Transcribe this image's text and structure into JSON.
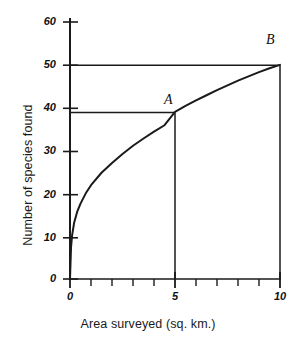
{
  "chart_data": {
    "type": "line",
    "title": "",
    "xlabel": "Area surveyed (sq. km.)",
    "ylabel": "Number of species found",
    "xlim": [
      0,
      10
    ],
    "ylim": [
      0,
      62
    ],
    "grid": false,
    "legend": null,
    "x_ticks_major": [
      0,
      5,
      10
    ],
    "x_tick_labels": [
      "0",
      "5",
      "10"
    ],
    "x_ticks_minor": [
      1,
      2,
      3,
      4,
      6,
      7,
      8,
      9
    ],
    "y_ticks": [
      0,
      10,
      20,
      30,
      40,
      50,
      60
    ],
    "y_tick_labels": [
      "0",
      "10",
      "20",
      "30",
      "40",
      "50",
      "60"
    ],
    "series": [
      {
        "name": "species-area curve",
        "x": [
          0,
          0.05,
          0.1,
          0.2,
          0.35,
          0.5,
          0.75,
          1.0,
          1.5,
          2.0,
          2.5,
          3.0,
          3.5,
          4.0,
          4.5,
          5.0,
          5.5,
          6.0,
          6.5,
          7.0,
          7.5,
          8.0,
          8.5,
          9.0,
          9.5,
          10.0
        ],
        "y": [
          0,
          7.5,
          10.2,
          13.2,
          15.8,
          17.6,
          20.0,
          21.9,
          24.8,
          27.1,
          29.2,
          31.1,
          32.8,
          34.4,
          35.9,
          39.0,
          40.4,
          41.7,
          42.9,
          44.1,
          45.2,
          46.3,
          47.3,
          48.3,
          49.2,
          50.0
        ]
      }
    ],
    "annotations": [
      {
        "label": "A",
        "x": 5,
        "y": 39,
        "guides": [
          "horizontal-to-y-axis",
          "vertical-to-x-axis"
        ]
      },
      {
        "label": "B",
        "x": 10,
        "y": 50,
        "guides": [
          "horizontal-to-y-axis",
          "vertical-to-x-axis"
        ]
      }
    ],
    "colors": {
      "curve": "#1a1a1a",
      "axis": "#1a1a1a",
      "guide": "#1a1a1a",
      "background": "#ffffff"
    }
  },
  "labels": {
    "xaxis_title": "Area surveyed (sq. km.)",
    "yaxis_title": "Number of species found",
    "point_a": "A",
    "point_b": "B",
    "y0": "0",
    "y10": "10",
    "y20": "20",
    "y30": "30",
    "y40": "40",
    "y50": "50",
    "y60": "60",
    "x0": "0",
    "x5": "5",
    "x10": "10"
  }
}
